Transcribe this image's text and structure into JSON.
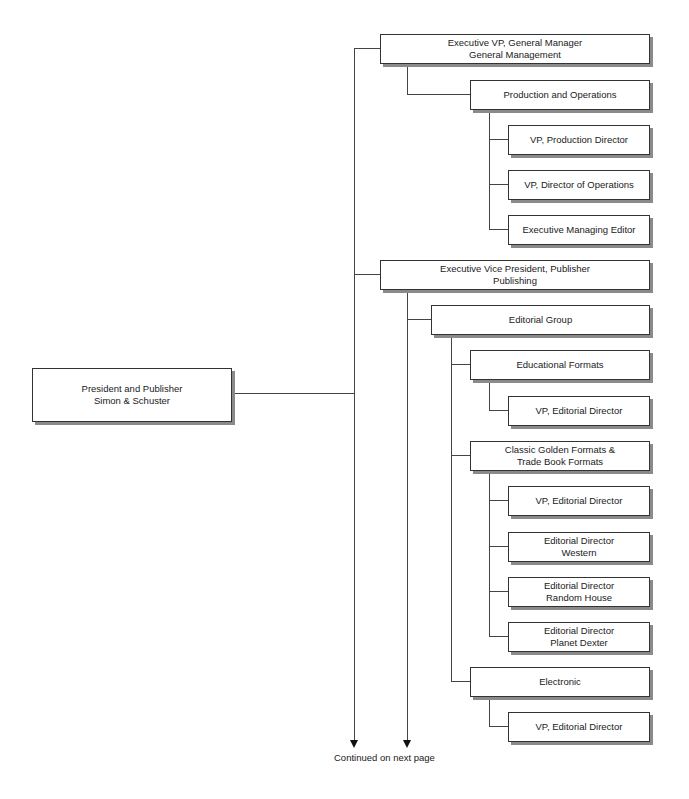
{
  "chart": {
    "root": {
      "line1": "President and Publisher",
      "line2": "Simon & Schuster"
    },
    "gm": {
      "line1": "Executive VP, General Manager",
      "line2": "General Management"
    },
    "prodops": {
      "line1": "Production and Operations"
    },
    "vp_prod": {
      "line1": "VP, Production Director"
    },
    "vp_ops": {
      "line1": "VP, Director of Operations"
    },
    "exec_me": {
      "line1": "Executive Managing Editor"
    },
    "pub": {
      "line1": "Executive Vice President, Publisher",
      "line2": "Publishing"
    },
    "edgroup": {
      "line1": "Editorial Group"
    },
    "eduformats": {
      "line1": "Educational Formats"
    },
    "edu_vp": {
      "line1": "VP, Editorial Director"
    },
    "classic": {
      "line1": "Classic Golden Formats &",
      "line2": "Trade Book Formats"
    },
    "classic_vp": {
      "line1": "VP, Editorial Director"
    },
    "western": {
      "line1": "Editorial Director",
      "line2": "Western"
    },
    "random": {
      "line1": "Editorial Director",
      "line2": "Random House"
    },
    "dexter": {
      "line1": "Editorial Director",
      "line2": "Planet Dexter"
    },
    "electronic": {
      "line1": "Electronic"
    },
    "elec_vp": {
      "line1": "VP, Editorial Director"
    }
  },
  "footer": {
    "continued": "Continued on next page"
  }
}
